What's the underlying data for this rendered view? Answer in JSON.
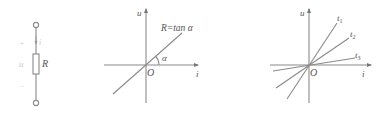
{
  "colors": {
    "line": "#8a8a8a",
    "text": "#555555",
    "faint_text": "#c8c8c8",
    "background": "#ffffff"
  },
  "circuit": {
    "plus_sign": "+",
    "minus_sign": "−",
    "current_label": "i",
    "voltage_label": "u",
    "resistor_label": "R"
  },
  "graph_linear": {
    "y_axis_label": "u",
    "x_axis_label": "i",
    "origin_label": "O",
    "line_label": "R=tan α",
    "angle_label": "α"
  },
  "graph_time_varying": {
    "y_axis_label": "u",
    "x_axis_label": "i",
    "origin_label": "O",
    "lines": [
      {
        "label": "t",
        "subscript": "1"
      },
      {
        "label": "t",
        "subscript": "2"
      },
      {
        "label": "t",
        "subscript": "3"
      }
    ]
  }
}
